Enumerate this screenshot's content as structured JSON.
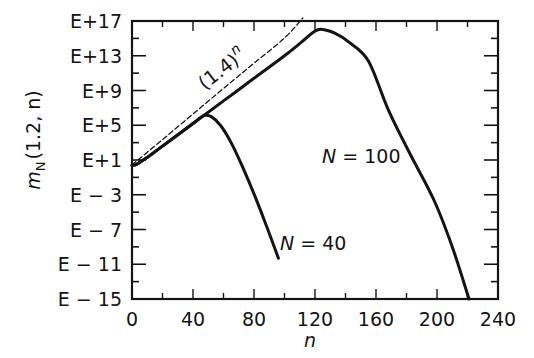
{
  "chart_data": {
    "type": "line",
    "title": "",
    "xlabel": "n",
    "ylabel": "m_N(1.2, n)",
    "ylabel_parts": {
      "main": "m",
      "sub": "N",
      "args": "(1.2, n)"
    },
    "xlim": [
      0,
      240
    ],
    "ylim_log10": [
      -15,
      17
    ],
    "y_scale": "log",
    "grid": false,
    "legend": "none (inline labels)",
    "x_ticks": [
      0,
      40,
      80,
      120,
      160,
      200,
      240
    ],
    "x_tick_labels": [
      "0",
      "40",
      "80",
      "120",
      "160",
      "200",
      "240"
    ],
    "x_minor_step": 20,
    "y_ticks_log10": [
      17,
      13,
      9,
      5,
      1,
      -3,
      -7,
      -11,
      -15
    ],
    "y_tick_labels": [
      "E+17",
      "E+13",
      "E+9",
      "E+5",
      "E+1",
      "E-3",
      "E-7",
      "E-11",
      "E-15"
    ],
    "y_minor_step_log10": 2,
    "series": [
      {
        "name": "(1.4)^n",
        "label_text": "(1.4)",
        "label_sup": "n",
        "style": "dashed",
        "x": [
          0,
          20,
          40,
          60,
          80,
          100,
          112
        ],
        "log10_y": [
          0.1,
          3.0,
          5.95,
          8.9,
          11.8,
          14.7,
          17.0
        ]
      },
      {
        "name": "N = 40",
        "label_text": "N = 40",
        "style": "solid",
        "x": [
          0,
          3,
          10,
          20,
          30,
          40,
          47,
          52,
          58,
          65,
          72,
          80,
          88,
          96
        ],
        "log10_y": [
          0.4,
          0.5,
          1.3,
          2.6,
          3.9,
          5.2,
          6.1,
          6.0,
          5.0,
          3.0,
          0.4,
          -2.9,
          -6.5,
          -10.3
        ]
      },
      {
        "name": "N = 100",
        "label_text": "N = 100",
        "style": "solid",
        "x": [
          0,
          3,
          10,
          20,
          40,
          60,
          80,
          100,
          112,
          118,
          122,
          126,
          133,
          142,
          155,
          168,
          182,
          198,
          210,
          221
        ],
        "log10_y": [
          0.4,
          0.5,
          1.3,
          2.6,
          5.2,
          7.8,
          10.4,
          13.0,
          14.7,
          15.6,
          16.0,
          16.0,
          15.6,
          14.6,
          12.4,
          6.8,
          1.8,
          -3.6,
          -9.0,
          -15.0
        ]
      }
    ],
    "annotations": [
      {
        "text": "(1.4)^n",
        "near_x": 62,
        "near_log10_y": 10.5
      },
      {
        "text": "N = 100",
        "near_x": 160,
        "near_log10_y": 2.5
      },
      {
        "text": "N = 40",
        "near_x": 112,
        "near_log10_y": -9.3
      }
    ]
  },
  "labels": {
    "x_axis_title": "n",
    "y_axis_main": "m",
    "y_axis_sub": "N",
    "y_axis_args": "(1.2, n)",
    "power_base": "(1.4)",
    "power_exp": "n",
    "n_var": "N",
    "n100_value": " = 100",
    "n40_value": " = 40"
  },
  "colors": {
    "ink": "#141414",
    "background": "#ffffff"
  }
}
